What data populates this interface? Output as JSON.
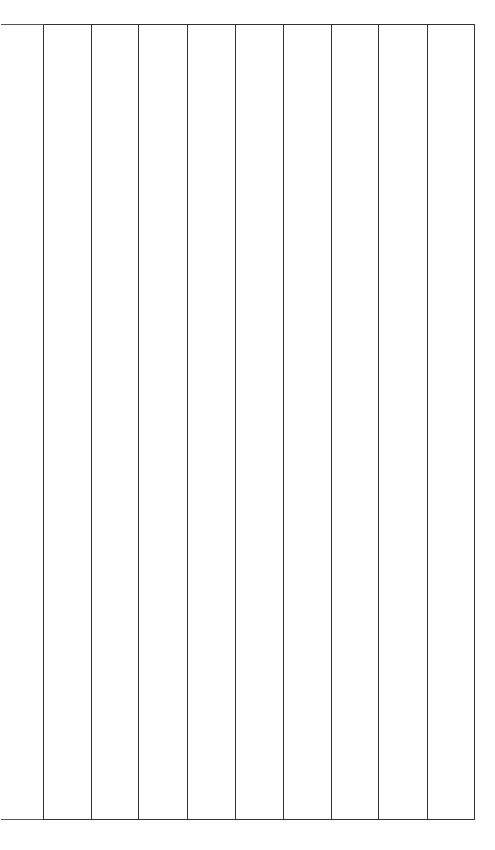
{
  "page": {
    "width": 495,
    "height": 850,
    "background_color": "#ffffff"
  },
  "figure": {
    "name": "empty-ruled-column-grid",
    "line_color": "#333333",
    "line_width": 1,
    "cell_fill": "#ffffff",
    "has_left_border": false,
    "has_right_border": true,
    "has_interior_horizontal_rules": false,
    "column_count": 9,
    "row_count": 1
  },
  "chart_data": {
    "type": "table",
    "title": "",
    "xlabel": "",
    "ylabel": "",
    "columns": [],
    "rows": [],
    "grid": true,
    "legend": "none",
    "geometry": {
      "top_rule_y": 24,
      "bottom_rule_y": 819,
      "horizontal_rule_x_start": 0,
      "horizontal_rule_x_end": 474,
      "vertical_rule_x_positions": [
        43,
        91,
        138,
        187,
        235,
        283,
        331,
        378,
        427,
        474
      ],
      "vertical_rule_y_start": 24,
      "vertical_rule_y_end": 819,
      "column_pitch": 47.9
    }
  }
}
